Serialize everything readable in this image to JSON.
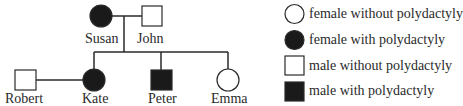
{
  "diagram": {
    "type": "pedigree",
    "trait": "polydactyly",
    "colors": {
      "affected": "#1a1a1a",
      "unaffected": "#ffffff",
      "line": "#2a2a2a"
    },
    "individuals": [
      {
        "name": "Susan",
        "sex": "female",
        "affected": true,
        "generation": 1
      },
      {
        "name": "John",
        "sex": "male",
        "affected": false,
        "generation": 1
      },
      {
        "name": "Robert",
        "sex": "male",
        "affected": false,
        "generation": 2
      },
      {
        "name": "Kate",
        "sex": "female",
        "affected": true,
        "generation": 2
      },
      {
        "name": "Peter",
        "sex": "male",
        "affected": true,
        "generation": 2
      },
      {
        "name": "Emma",
        "sex": "female",
        "affected": false,
        "generation": 2
      }
    ],
    "relationships": [
      {
        "type": "mating",
        "partners": [
          "Susan",
          "John"
        ],
        "children": [
          "Kate",
          "Peter",
          "Emma"
        ]
      },
      {
        "type": "mating",
        "partners": [
          "Robert",
          "Kate"
        ],
        "children": []
      }
    ]
  },
  "labels": {
    "susan": "Susan",
    "john": "John",
    "robert": "Robert",
    "kate": "Kate",
    "peter": "Peter",
    "emma": "Emma"
  },
  "legend": {
    "items": [
      {
        "symbol": "open-circle",
        "label": "female without polydactyly"
      },
      {
        "symbol": "filled-circle",
        "label": "female with polydactyly"
      },
      {
        "symbol": "open-square",
        "label": "male without polydactyly"
      },
      {
        "symbol": "filled-square",
        "label": "male with polydactyly"
      }
    ]
  }
}
